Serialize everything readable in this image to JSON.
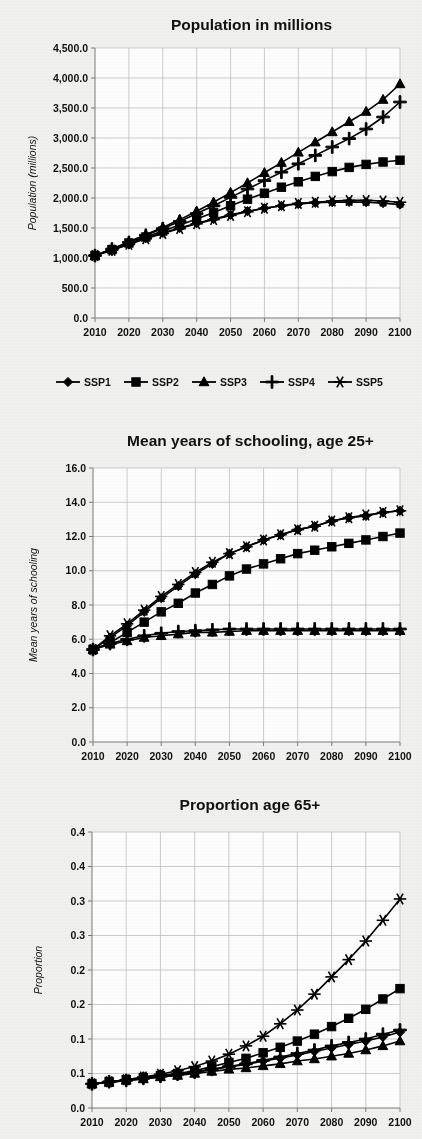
{
  "figure": {
    "background_color": "#f2f2f0",
    "line_color": "#000000",
    "grid_color": "#b9b9b9"
  },
  "legend": {
    "position": "below-first-chart",
    "entries": [
      {
        "label": "SSP1",
        "marker": "diamond"
      },
      {
        "label": "SSP2",
        "marker": "square"
      },
      {
        "label": "SSP3",
        "marker": "triangle"
      },
      {
        "label": "SSP4",
        "marker": "plus"
      },
      {
        "label": "SSP5",
        "marker": "asterisk"
      }
    ]
  },
  "chart_data": [
    {
      "type": "line",
      "title": "Population in millions",
      "xlabel": "",
      "ylabel": "Population (millions)",
      "x": [
        2010,
        2015,
        2020,
        2025,
        2030,
        2035,
        2040,
        2045,
        2050,
        2055,
        2060,
        2065,
        2070,
        2075,
        2080,
        2085,
        2090,
        2095,
        2100
      ],
      "xtick_labels": [
        "2010",
        "2020",
        "2030",
        "2040",
        "2050",
        "2060",
        "2070",
        "2080",
        "2090",
        "2100"
      ],
      "xticks": [
        2010,
        2020,
        2030,
        2040,
        2050,
        2060,
        2070,
        2080,
        2090,
        2100
      ],
      "xlim": [
        2010,
        2100
      ],
      "ylim": [
        0,
        4500
      ],
      "yticks": [
        0,
        500,
        1000,
        1500,
        2000,
        2500,
        3000,
        3500,
        4000,
        4500
      ],
      "ytick_labels": [
        "0.0",
        "500.0",
        "1,000.0",
        "1,500.0",
        "2,000.0",
        "2,500.0",
        "3,000.0",
        "3,500.0",
        "4,000.0",
        "4,500.0"
      ],
      "grid": true,
      "series": [
        {
          "name": "SSP1",
          "marker": "diamond",
          "values": [
            1040,
            1130,
            1230,
            1330,
            1420,
            1500,
            1580,
            1650,
            1720,
            1780,
            1830,
            1870,
            1900,
            1920,
            1930,
            1935,
            1930,
            1915,
            1890
          ]
        },
        {
          "name": "SSP2",
          "marker": "square",
          "values": [
            1040,
            1140,
            1250,
            1350,
            1450,
            1550,
            1650,
            1760,
            1870,
            1980,
            2080,
            2180,
            2270,
            2360,
            2440,
            2510,
            2560,
            2600,
            2630
          ]
        },
        {
          "name": "SSP3",
          "marker": "triangle",
          "values": [
            1040,
            1150,
            1270,
            1390,
            1510,
            1640,
            1780,
            1930,
            2090,
            2250,
            2420,
            2590,
            2760,
            2930,
            3100,
            3270,
            3440,
            3640,
            3900
          ]
        },
        {
          "name": "SSP4",
          "marker": "plus",
          "values": [
            1040,
            1150,
            1260,
            1380,
            1490,
            1610,
            1740,
            1870,
            2010,
            2150,
            2290,
            2430,
            2570,
            2710,
            2850,
            2990,
            3150,
            3350,
            3600
          ]
        },
        {
          "name": "SSP5",
          "marker": "asterisk",
          "values": [
            1040,
            1130,
            1230,
            1320,
            1410,
            1490,
            1570,
            1640,
            1710,
            1770,
            1830,
            1870,
            1910,
            1930,
            1950,
            1960,
            1960,
            1950,
            1930
          ]
        }
      ]
    },
    {
      "type": "line",
      "title": "Mean years of schooling, age 25+",
      "xlabel": "",
      "ylabel": "Mean years of schooling",
      "x": [
        2010,
        2015,
        2020,
        2025,
        2030,
        2035,
        2040,
        2045,
        2050,
        2055,
        2060,
        2065,
        2070,
        2075,
        2080,
        2085,
        2090,
        2095,
        2100
      ],
      "xtick_labels": [
        "2010",
        "2020",
        "2030",
        "2040",
        "2050",
        "2060",
        "2070",
        "2080",
        "2090",
        "2100"
      ],
      "xticks": [
        2010,
        2020,
        2030,
        2040,
        2050,
        2060,
        2070,
        2080,
        2090,
        2100
      ],
      "xlim": [
        2010,
        2100
      ],
      "ylim": [
        0,
        16
      ],
      "yticks": [
        0,
        2,
        4,
        6,
        8,
        10,
        12,
        14,
        16
      ],
      "ytick_labels": [
        "0.0",
        "2.0",
        "4.0",
        "6.0",
        "8.0",
        "10.0",
        "12.0",
        "14.0",
        "16.0"
      ],
      "grid": true,
      "series": [
        {
          "name": "SSP1",
          "marker": "diamond",
          "values": [
            5.4,
            6.1,
            6.8,
            7.6,
            8.4,
            9.1,
            9.8,
            10.4,
            11.0,
            11.4,
            11.8,
            12.1,
            12.4,
            12.6,
            12.9,
            13.1,
            13.2,
            13.4,
            13.5
          ]
        },
        {
          "name": "SSP2",
          "marker": "square",
          "values": [
            5.4,
            5.8,
            6.4,
            7.0,
            7.6,
            8.1,
            8.7,
            9.2,
            9.7,
            10.1,
            10.4,
            10.7,
            11.0,
            11.2,
            11.4,
            11.6,
            11.8,
            12.0,
            12.2
          ]
        },
        {
          "name": "SSP3",
          "marker": "triangle",
          "values": [
            5.4,
            5.7,
            5.9,
            6.1,
            6.2,
            6.3,
            6.4,
            6.4,
            6.45,
            6.5,
            6.5,
            6.5,
            6.5,
            6.5,
            6.5,
            6.5,
            6.5,
            6.5,
            6.5
          ]
        },
        {
          "name": "SSP4",
          "marker": "plus",
          "values": [
            5.4,
            5.75,
            6.0,
            6.2,
            6.35,
            6.45,
            6.5,
            6.55,
            6.6,
            6.6,
            6.6,
            6.6,
            6.6,
            6.6,
            6.6,
            6.6,
            6.6,
            6.6,
            6.6
          ]
        },
        {
          "name": "SSP5",
          "marker": "asterisk",
          "values": [
            5.4,
            6.2,
            6.9,
            7.7,
            8.5,
            9.2,
            9.9,
            10.5,
            11.0,
            11.4,
            11.8,
            12.1,
            12.4,
            12.6,
            12.9,
            13.1,
            13.25,
            13.4,
            13.5
          ]
        }
      ]
    },
    {
      "type": "line",
      "title": "Proportion age 65+",
      "xlabel": "",
      "ylabel": "Proportion",
      "x": [
        2010,
        2015,
        2020,
        2025,
        2030,
        2035,
        2040,
        2045,
        2050,
        2055,
        2060,
        2065,
        2070,
        2075,
        2080,
        2085,
        2090,
        2095,
        2100
      ],
      "xtick_labels": [
        "2010",
        "2020",
        "2030",
        "2040",
        "2050",
        "2060",
        "2070",
        "2080",
        "2090",
        "2100"
      ],
      "xticks": [
        2010,
        2020,
        2030,
        2040,
        2050,
        2060,
        2070,
        2080,
        2090,
        2100
      ],
      "xlim": [
        2010,
        2100
      ],
      "ylim": [
        0,
        0.4
      ],
      "yticks": [
        0,
        0.05,
        0.1,
        0.15,
        0.2,
        0.25,
        0.3,
        0.35,
        0.4
      ],
      "ytick_labels": [
        "0.0",
        "0.1",
        "0.1",
        "0.2",
        "0.2",
        "0.3",
        "0.3",
        "0.4",
        "0.4"
      ],
      "grid": true,
      "series": [
        {
          "name": "SSP1",
          "marker": "diamond",
          "values": [
            0.035,
            0.037,
            0.04,
            0.042,
            0.045,
            0.048,
            0.052,
            0.056,
            0.06,
            0.063,
            0.068,
            0.072,
            0.077,
            0.082,
            0.087,
            0.092,
            0.097,
            0.103,
            0.11
          ]
        },
        {
          "name": "SSP2",
          "marker": "square",
          "values": [
            0.035,
            0.038,
            0.041,
            0.044,
            0.047,
            0.05,
            0.054,
            0.06,
            0.066,
            0.072,
            0.08,
            0.088,
            0.097,
            0.107,
            0.118,
            0.13,
            0.143,
            0.158,
            0.173
          ]
        },
        {
          "name": "SSP3",
          "marker": "triangle",
          "values": [
            0.035,
            0.037,
            0.04,
            0.042,
            0.045,
            0.047,
            0.05,
            0.053,
            0.056,
            0.058,
            0.061,
            0.064,
            0.068,
            0.071,
            0.075,
            0.079,
            0.084,
            0.09,
            0.097
          ]
        },
        {
          "name": "SSP4",
          "marker": "plus",
          "values": [
            0.035,
            0.038,
            0.04,
            0.043,
            0.046,
            0.049,
            0.052,
            0.056,
            0.06,
            0.064,
            0.069,
            0.074,
            0.079,
            0.084,
            0.09,
            0.095,
            0.1,
            0.107,
            0.113
          ]
        },
        {
          "name": "SSP5",
          "marker": "asterisk",
          "values": [
            0.035,
            0.038,
            0.041,
            0.045,
            0.049,
            0.054,
            0.06,
            0.068,
            0.078,
            0.09,
            0.104,
            0.122,
            0.142,
            0.165,
            0.19,
            0.215,
            0.242,
            0.272,
            0.303
          ]
        }
      ]
    }
  ]
}
